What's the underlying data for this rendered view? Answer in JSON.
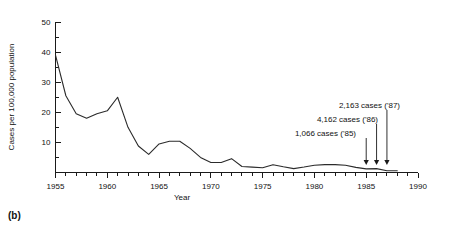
{
  "figure": {
    "caption_label": "(b)"
  },
  "chart_data": {
    "type": "line",
    "title": "",
    "xlabel": "Year",
    "ylabel": "Cases per 100,000 population",
    "xlim": [
      1955,
      1990
    ],
    "ylim": [
      0,
      50
    ],
    "grid": false,
    "legend": "none",
    "x_tick_labels": [
      "1955",
      "1960",
      "1965",
      "1970",
      "1975",
      "1980",
      "1985",
      "1990"
    ],
    "x_tick_values": [
      1955,
      1960,
      1965,
      1970,
      1975,
      1980,
      1985,
      1990
    ],
    "x_minor_tick_step": 1,
    "y_tick_labels": [
      "10",
      "20",
      "30",
      "40",
      "50"
    ],
    "y_tick_values": [
      10,
      20,
      30,
      40,
      50
    ],
    "y_minor_tick_step": 5,
    "x": [
      1955,
      1956,
      1957,
      1958,
      1959,
      1960,
      1961,
      1962,
      1963,
      1964,
      1965,
      1966,
      1967,
      1968,
      1969,
      1970,
      1971,
      1972,
      1973,
      1974,
      1975,
      1976,
      1977,
      1978,
      1979,
      1980,
      1981,
      1982,
      1983,
      1984,
      1985,
      1986,
      1987,
      1988
    ],
    "values": [
      39.0,
      25.5,
      19.5,
      18.0,
      19.5,
      20.5,
      25.0,
      15.0,
      8.8,
      6.0,
      9.5,
      10.4,
      10.4,
      8.0,
      5.0,
      3.3,
      3.3,
      4.6,
      2.0,
      1.8,
      1.6,
      2.6,
      1.9,
      1.3,
      1.8,
      2.4,
      2.6,
      2.6,
      2.4,
      1.7,
      1.2,
      1.3,
      0.6,
      0.6
    ],
    "series": [
      {
        "name": "Cases per 100,000 population",
        "values": [
          39.0,
          25.5,
          19.5,
          18.0,
          19.5,
          20.5,
          25.0,
          15.0,
          8.8,
          6.0,
          9.5,
          10.4,
          10.4,
          8.0,
          5.0,
          3.3,
          3.3,
          4.6,
          2.0,
          1.8,
          1.6,
          2.6,
          1.9,
          1.3,
          1.8,
          2.4,
          2.6,
          2.6,
          2.4,
          1.7,
          1.2,
          1.3,
          0.6,
          0.6
        ]
      }
    ],
    "annotations": [
      {
        "id": "a87",
        "text": "2,163 cases ('87)",
        "cases": 2163,
        "year": 1987
      },
      {
        "id": "a86",
        "text": "4,162 cases ('86)",
        "cases": 4162,
        "year": 1986
      },
      {
        "id": "a85",
        "text": "1,066 cases ('85)",
        "cases": 1066,
        "year": 1985
      }
    ],
    "colors": {
      "line": "#2b2b2b",
      "axis": "#1a1a1a",
      "text": "#111111",
      "background": "#ffffff"
    }
  }
}
